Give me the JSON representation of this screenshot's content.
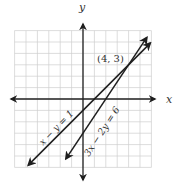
{
  "chart_data": {
    "type": "line",
    "title": "",
    "xlabel": "x",
    "ylabel": "y",
    "xlim": [
      -6,
      6
    ],
    "ylim": [
      -6,
      6
    ],
    "grid": true,
    "grid_step": 1,
    "tick_labels": false,
    "series": [
      {
        "name": "x − y = 1",
        "equation": "x - y = 1",
        "slope": 1,
        "intercept": -1,
        "x": [
          -4.8,
          5.9
        ],
        "y": [
          -5.8,
          4.9
        ],
        "arrows": "both"
      },
      {
        "name": "3x − 2y = 6",
        "equation": "3x - 2y = 6",
        "slope": 1.5,
        "intercept": -3,
        "x": [
          -1.5,
          5.6
        ],
        "y": [
          -5.25,
          5.4
        ],
        "arrows": "both"
      }
    ],
    "annotations": [
      {
        "text": "(4, 3)",
        "x": 4,
        "y": 3,
        "note": "intersection point"
      }
    ]
  },
  "labels": {
    "x_axis": "x",
    "y_axis": "y",
    "intersection": "(4, 3)",
    "line1": "x − y = 1",
    "line2": "3x − 2y = 6"
  }
}
